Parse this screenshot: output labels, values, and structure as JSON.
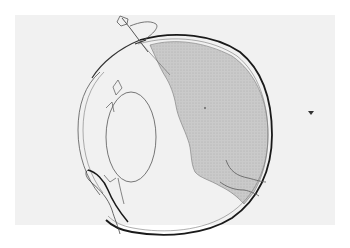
{
  "figure": {
    "type": "anatomical-illustration",
    "colors": {
      "page_background": "#ffffff",
      "panel_background": "#f1f1f1",
      "outline_dark": "#1a1a1a",
      "outline_light": "#555555",
      "shaded_region": "#c8c8c8",
      "shaded_dots": "#9a9a9a",
      "marker": "#333333"
    },
    "parts": [
      {
        "name": "sclera-outer-wall",
        "icon": "eye-wall-icon"
      },
      {
        "name": "cornea",
        "icon": "cornea-icon"
      },
      {
        "name": "lens",
        "icon": "lens-icon"
      },
      {
        "name": "shaded-posterior-region",
        "icon": "vitreous-icon"
      },
      {
        "name": "surgical-instrument",
        "icon": "instrument-icon"
      },
      {
        "name": "optic-nerve",
        "icon": "optic-nerve-icon"
      },
      {
        "name": "eyelid",
        "icon": "eyelid-icon"
      },
      {
        "name": "marker-arrow",
        "icon": "arrowhead-icon"
      }
    ]
  }
}
